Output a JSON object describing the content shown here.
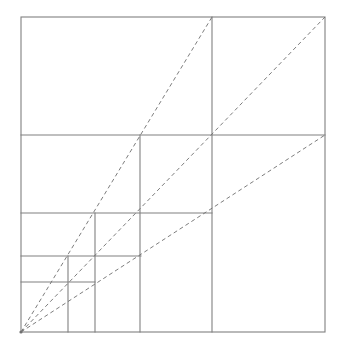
{
  "figure": {
    "kind": "geometric-diagram",
    "background_color": "#ffffff",
    "solid_line_color": "#808080",
    "dashed_line_color": "#6e6e6e",
    "solid_line_width": 1.1,
    "dashed_line_width": 0.9,
    "dash_pattern": "4 3",
    "canvas": {
      "width": 342,
      "height": 354
    }
  },
  "geometry": {
    "outer_square": {
      "label": "outer-square",
      "x": 21,
      "y": 17,
      "width": 304,
      "height": 315,
      "left": 21,
      "right": 325,
      "top": 17,
      "bottom": 332
    },
    "horizontal_lines": [
      {
        "name": "horizontal-divider-1",
        "y": 135,
        "x1": 21,
        "x2": 325
      },
      {
        "name": "horizontal-divider-2",
        "y": 213,
        "x1": 21,
        "x2": 212
      },
      {
        "name": "horizontal-divider-3",
        "y": 256,
        "x1": 21,
        "x2": 141
      },
      {
        "name": "horizontal-divider-4",
        "y": 282,
        "x1": 21,
        "x2": 95
      }
    ],
    "vertical_lines": [
      {
        "name": "vertical-divider-1",
        "x": 212,
        "y1": 17,
        "y2": 332
      },
      {
        "name": "vertical-divider-2",
        "x": 140,
        "y1": 135,
        "y2": 332
      },
      {
        "name": "vertical-divider-3",
        "x": 95,
        "y1": 213,
        "y2": 332
      },
      {
        "name": "vertical-divider-4",
        "x": 68,
        "y1": 256,
        "y2": 332
      }
    ],
    "rays": [
      {
        "name": "dashed-ray-steep",
        "x1": 21,
        "y1": 332,
        "x2": 212,
        "y2": 17,
        "note": "steepest ray, ends on top edge at x=212"
      },
      {
        "name": "dashed-ray-diagonal",
        "x1": 21,
        "y1": 332,
        "x2": 325,
        "y2": 17,
        "note": "main diagonal ray, ends at top-right corner"
      },
      {
        "name": "dashed-ray-shallow",
        "x1": 21,
        "y1": 332,
        "x2": 325,
        "y2": 135,
        "note": "shallowest ray, ends on right edge at y=135"
      }
    ],
    "ray_origin": {
      "name": "ray-origin-corner",
      "x": 21,
      "y": 332
    }
  }
}
